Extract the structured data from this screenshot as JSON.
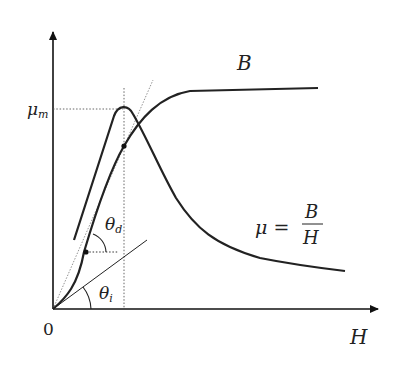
{
  "diagram": {
    "axes": {
      "x_label": "H",
      "origin_label": "0",
      "y_tick_label_main": "μ",
      "y_tick_label_sub": "m"
    },
    "curves": {
      "b_curve_label": "B",
      "mu_curve_label_lhs": "μ =",
      "mu_curve_label_num": "B",
      "mu_curve_label_den": "H"
    },
    "angles": {
      "theta_d_main": "θ",
      "theta_d_sub": "d",
      "theta_i_main": "θ",
      "theta_i_sub": "i"
    },
    "colors": {
      "curve": "#222222",
      "axis": "#111111",
      "guide": "#555555",
      "background": "#ffffff"
    }
  }
}
